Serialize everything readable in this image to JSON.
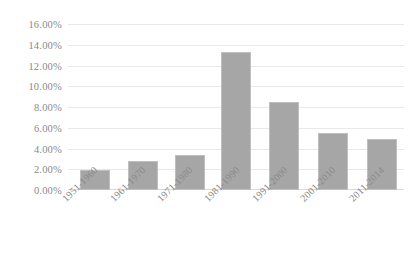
{
  "chart_data": {
    "type": "bar",
    "title": "",
    "xlabel": "",
    "ylabel": "",
    "categories": [
      "1951-1960",
      "1961-1970",
      "1971-1980",
      "1981-1990",
      "1991-2000",
      "2001-2010",
      "2011-2014"
    ],
    "values": [
      1.9,
      2.8,
      3.4,
      13.3,
      8.5,
      5.5,
      4.9
    ],
    "value_labels": [
      "1.90%",
      "2.80%",
      "3.40%",
      "13.30%",
      "8.50%",
      "5.50%",
      "4.90%"
    ],
    "ylim": [
      0,
      16
    ],
    "ytick_values": [
      0,
      2,
      4,
      6,
      8,
      10,
      12,
      14,
      16
    ],
    "ytick_labels": [
      "0.00%",
      "2.00%",
      "4.00%",
      "6.00%",
      "8.00%",
      "10.00%",
      "12.00%",
      "14.00%",
      "16.00%"
    ],
    "grid": true,
    "legend": false,
    "series_color": "#a6a6a6",
    "gridline_color": "#e8e8e8",
    "axis_text_color": "#8a8a8a",
    "background_color": "#ffffff",
    "xlabel_rotation": -45
  }
}
